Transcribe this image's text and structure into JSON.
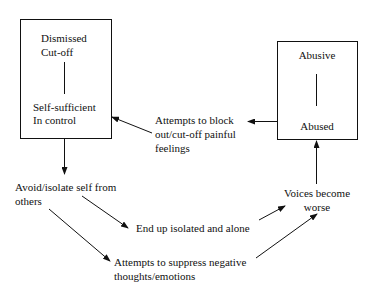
{
  "diagram": {
    "type": "flow-cycle",
    "left_box": {
      "top_lines": [
        "Dismissed",
        "Cut-off"
      ],
      "bottom_lines": [
        "Self-sufficient",
        "In control"
      ]
    },
    "right_box": {
      "top_label": "Abusive",
      "bottom_label": "Abused"
    },
    "nodes": {
      "block_feelings": [
        "Attempts to block",
        "out/cut-off painful",
        "feelings"
      ],
      "avoid_isolate": [
        "Avoid/isolate self from",
        "others"
      ],
      "isolated_alone": "End up isolated and alone",
      "suppress": [
        "Attempts to suppress negative",
        "thoughts/emotions"
      ],
      "voices_worse": [
        "Voices become",
        "worse"
      ]
    },
    "edges": [
      {
        "from": "left_box",
        "to": "avoid_isolate"
      },
      {
        "from": "avoid_isolate",
        "to": "isolated_alone"
      },
      {
        "from": "avoid_isolate",
        "to": "suppress"
      },
      {
        "from": "isolated_alone",
        "to": "voices_worse"
      },
      {
        "from": "suppress",
        "to": "voices_worse"
      },
      {
        "from": "voices_worse",
        "to": "right_box"
      },
      {
        "from": "right_box",
        "to": "block_feelings"
      },
      {
        "from": "block_feelings",
        "to": "left_box"
      }
    ],
    "colors": {
      "line": "#111111",
      "background": "#ffffff"
    }
  }
}
